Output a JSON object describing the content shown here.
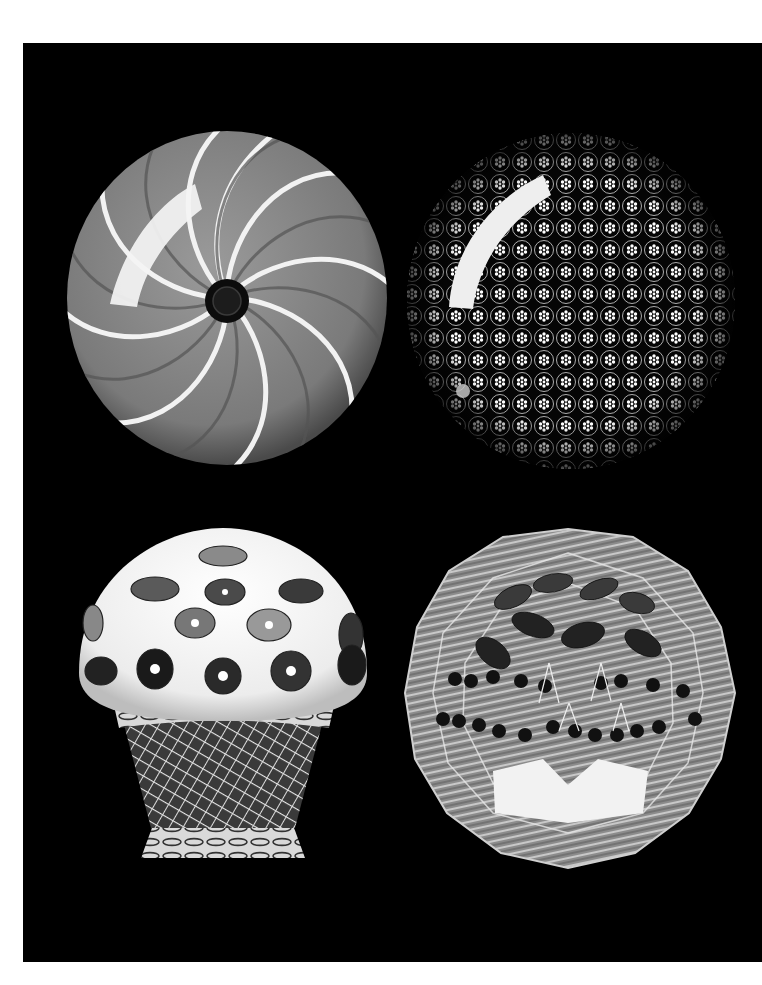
{
  "page": {
    "background": "#ffffff",
    "plate_color": "#000000",
    "layout": "2x2 grid of photographs on black"
  },
  "objects": [
    {
      "id": "swirl-paperweight",
      "description": "Swirl paperweight with grey bands and white spiral lines around a dark central cane",
      "position": "top-left"
    },
    {
      "id": "millefiori-paperweight",
      "description": "Close-packed millefiori paperweight with concentric rings of white flower canes",
      "position": "top-right"
    },
    {
      "id": "mushroom-paperweight",
      "description": "Mushroom paperweight with scattered canes on white ground above latticinio basket with twisted torsade",
      "position": "bottom-left"
    },
    {
      "id": "faceted-fruit-paperweight",
      "description": "Faceted paperweight with cherries and leaves over latticinio ground",
      "position": "bottom-right"
    }
  ]
}
